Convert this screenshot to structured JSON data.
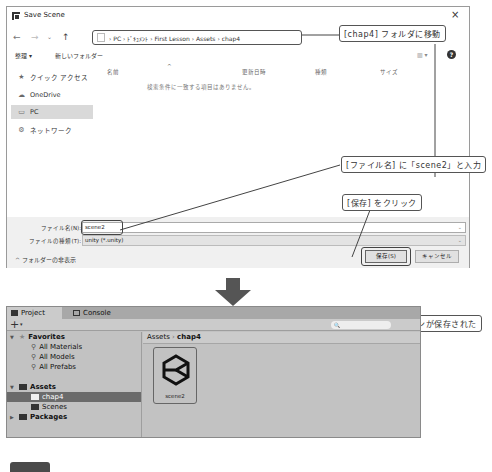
{
  "dialog": {
    "title": "Save Scene",
    "close_icon": "×",
    "nav": {
      "back": "←",
      "forward": "→",
      "up_dropdown": "⌄",
      "up": "↑"
    },
    "address_path": "› PC › ﾄﾞｷｭﾒﾝﾄ › First Lesson › Assets › chap4",
    "address_dropdown": "⌄",
    "refresh": "↻",
    "toolbar": {
      "organize": "整理 ▾",
      "new_folder": "新しいフォルダー",
      "view": "▥ ▾",
      "help": "?"
    },
    "columns": {
      "name": "名前",
      "sort_indicator": "^",
      "modified": "更新日時",
      "type": "種類",
      "size": "サイズ"
    },
    "empty_message": "検索条件に一致する項目はありません。",
    "sidebar": [
      {
        "label": "クイック アクセス",
        "icon": "★"
      },
      {
        "label": "OneDrive",
        "icon": "☁"
      },
      {
        "label": "PC",
        "icon": "▭"
      },
      {
        "label": "ネットワーク",
        "icon": "⚙"
      }
    ],
    "filename_label": "ファイル名(N):",
    "filename_value": "scene2",
    "filetype_label": "ファイルの種類(T):",
    "filetype_value": "unity (*.unity)",
    "hide_folders": "^ フォルダーの非表示",
    "save_button": "保存(S)",
    "cancel_button": "キャンセル"
  },
  "callouts": {
    "move_folder": "[chap4] フォルダに移動",
    "enter_name": "[ファイル名] に「scene2」と入力",
    "click_save": "[保存] をクリック",
    "scene_saved": "シーンが保存された"
  },
  "unity": {
    "tabs": [
      {
        "label": "Project"
      },
      {
        "label": "Console"
      }
    ],
    "add_button": "+",
    "add_caret": "▾",
    "search_placeholder": "🔍",
    "tree": {
      "favorites": "Favorites",
      "fav_items": [
        "All Materials",
        "All Models",
        "All Prefabs"
      ],
      "assets": "Assets",
      "asset_items": [
        "chap4",
        "Scenes"
      ],
      "packages": "Packages"
    },
    "breadcrumb": {
      "root": "Assets",
      "sep": "›",
      "current": "chap4"
    },
    "asset": {
      "name": "scene2"
    }
  }
}
